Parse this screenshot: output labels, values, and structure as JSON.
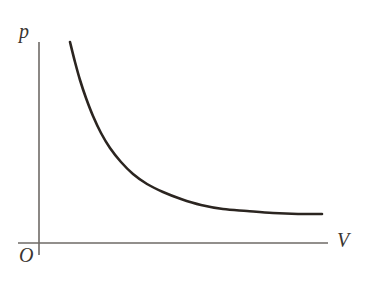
{
  "figure": {
    "title": "",
    "background_color": "#ffffff",
    "width": 369,
    "height": 283
  },
  "labels": {
    "y_axis": "p",
    "x_axis": "V",
    "origin": "O"
  },
  "colors": {
    "curve": "#2b2520",
    "axis": "#6e6a66",
    "label_text": "#3a3530",
    "background": "#ffffff"
  },
  "chart_data": {
    "type": "line",
    "title": "",
    "xlabel": "V",
    "ylabel": "p",
    "grid": false,
    "legend": null,
    "annotations": [
      "O"
    ],
    "axis_style": "arrowless-open-axes",
    "relationship": "inverse proportion (p = k / V), isothermal Boyle's law hyperbola",
    "xlim": [
      0,
      1
    ],
    "ylim": [
      0,
      1
    ],
    "x": [
      0.12,
      0.15,
      0.18,
      0.22,
      0.27,
      0.32,
      0.38,
      0.45,
      0.53,
      0.62,
      0.72,
      0.83,
      0.95,
      1.0
    ],
    "y": [
      1.0,
      0.8,
      0.667,
      0.545,
      0.444,
      0.375,
      0.316,
      0.267,
      0.226,
      0.194,
      0.167,
      0.145,
      0.126,
      0.12
    ],
    "series": [
      {
        "name": "p = k / V",
        "values": [
          1.0,
          0.8,
          0.667,
          0.545,
          0.444,
          0.375,
          0.316,
          0.267,
          0.226,
          0.194,
          0.167,
          0.145,
          0.126,
          0.12
        ]
      }
    ],
    "curve_pixel_path": {
      "start": [
        70,
        42
      ],
      "end": [
        322,
        214
      ],
      "samples": [
        [
          70,
          42
        ],
        [
          75,
          62
        ],
        [
          80,
          80
        ],
        [
          86,
          98
        ],
        [
          93,
          116
        ],
        [
          101,
          133
        ],
        [
          110,
          148
        ],
        [
          121,
          162
        ],
        [
          133,
          174
        ],
        [
          147,
          184
        ],
        [
          163,
          192
        ],
        [
          181,
          199
        ],
        [
          201,
          205
        ],
        [
          223,
          209
        ],
        [
          247,
          211
        ],
        [
          273,
          213
        ],
        [
          298,
          214
        ],
        [
          322,
          214
        ]
      ]
    },
    "axes_pixels": {
      "y_axis": {
        "x": 39,
        "y_top": 42,
        "y_bottom": 255
      },
      "x_axis": {
        "y": 243,
        "x_left": 18,
        "x_right": 328
      }
    }
  }
}
